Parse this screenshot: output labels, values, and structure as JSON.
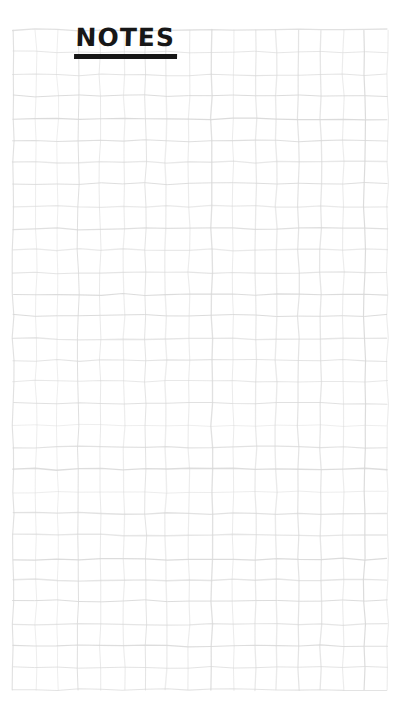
{
  "page": {
    "title": "NOTES",
    "background_color": "#ffffff",
    "title_color": "#171717"
  },
  "grid": {
    "line_color": "#d8d8d8",
    "cell_size": 22,
    "left": 13,
    "top": 30,
    "columns": 17,
    "rows": 30
  }
}
